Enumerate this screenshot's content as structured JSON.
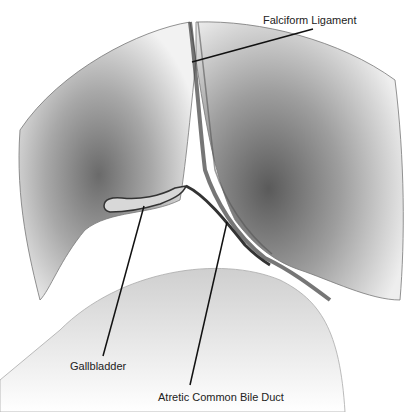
{
  "figure": {
    "type": "anatomical-illustration",
    "labels": [
      {
        "id": "falciform",
        "text": "Falciform Ligament"
      },
      {
        "id": "gallbladder",
        "text": "Gallbladder"
      },
      {
        "id": "atretic-cbd",
        "text": "Atretic Common Bile Duct"
      }
    ]
  }
}
